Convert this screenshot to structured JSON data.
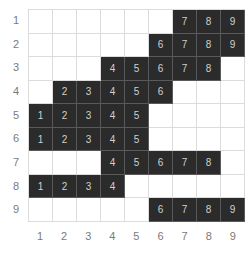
{
  "row_labels": [
    "1",
    "2",
    "3",
    "4",
    "5",
    "6",
    "7",
    "8",
    "9"
  ],
  "col_labels": [
    "1",
    "2",
    "3",
    "4",
    "5",
    "6",
    "7",
    "8",
    "9"
  ],
  "colors": {
    "filled": "#2b2b2b",
    "empty": "#ffffff",
    "grid_line": "#dcdcdc",
    "label": "#7a7a7a"
  },
  "grid": [
    [
      "",
      "",
      "",
      "",
      "",
      "",
      "7",
      "8",
      "9"
    ],
    [
      "",
      "",
      "",
      "",
      "",
      "6",
      "7",
      "8",
      "9"
    ],
    [
      "",
      "",
      "",
      "4",
      "5",
      "6",
      "7",
      "8",
      ""
    ],
    [
      "",
      "2",
      "3",
      "4",
      "5",
      "6",
      "",
      "",
      ""
    ],
    [
      "1",
      "2",
      "3",
      "4",
      "5",
      "",
      "",
      "",
      ""
    ],
    [
      "1",
      "2",
      "3",
      "4",
      "5",
      "",
      "",
      "",
      ""
    ],
    [
      "",
      "",
      "",
      "4",
      "5",
      "6",
      "7",
      "8",
      ""
    ],
    [
      "1",
      "2",
      "3",
      "4",
      "",
      "",
      "",
      "",
      ""
    ],
    [
      "",
      "",
      "",
      "",
      "",
      "6",
      "7",
      "8",
      "9"
    ]
  ]
}
